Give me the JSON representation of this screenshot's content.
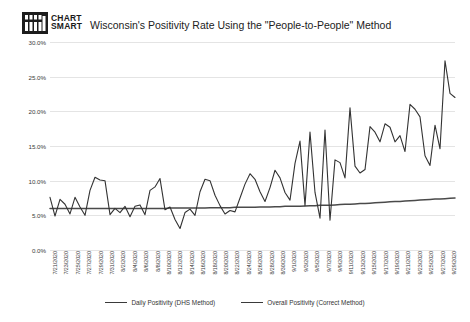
{
  "logo": {
    "name": "Chart Smart",
    "line1": "CHART",
    "line2": "SMART"
  },
  "header": {
    "title": "Wisconsin's Positivity Rate Using the \"People-to-People\" Method"
  },
  "legend": {
    "position": "bottom-center",
    "items": [
      {
        "label": "Daily Positivity (DHS Method)",
        "color": "#3a3a3a"
      },
      {
        "label": "Overall Positivity (Correct Method)",
        "color": "#3a3a3a"
      }
    ]
  },
  "axis": {
    "y_ticks": [
      "0.0%",
      "5.0%",
      "10.0%",
      "15.0%",
      "20.0%",
      "25.0%",
      "30.0%"
    ],
    "y_tick_values": [
      0,
      5,
      10,
      15,
      20,
      25,
      30
    ]
  },
  "chart_data": {
    "type": "line",
    "title": "Wisconsin's Positivity Rate Using the \"People-to-People\" Method",
    "xlabel": "",
    "ylabel": "",
    "ylim": [
      0,
      30
    ],
    "grid": true,
    "legend_position": "bottom",
    "x": [
      "7/21/2020",
      "7/22/2020",
      "7/23/2020",
      "7/24/2020",
      "7/25/2020",
      "7/26/2020",
      "7/27/2020",
      "7/28/2020",
      "7/29/2020",
      "7/30/2020",
      "7/31/2020",
      "8/1/2020",
      "8/2/2020",
      "8/3/2020",
      "8/4/2020",
      "8/5/2020",
      "8/6/2020",
      "8/7/2020",
      "8/8/2020",
      "8/9/2020",
      "8/10/2020",
      "8/11/2020",
      "8/12/2020",
      "8/13/2020",
      "8/14/2020",
      "8/15/2020",
      "8/16/2020",
      "8/17/2020",
      "8/18/2020",
      "8/19/2020",
      "8/20/2020",
      "8/21/2020",
      "8/22/2020",
      "8/23/2020",
      "8/24/2020",
      "8/25/2020",
      "8/26/2020",
      "8/27/2020",
      "8/28/2020",
      "8/29/2020",
      "8/30/2020",
      "8/31/2020",
      "9/1/2020",
      "9/2/2020",
      "9/3/2020",
      "9/4/2020",
      "9/5/2020",
      "9/6/2020",
      "9/7/2020",
      "9/8/2020",
      "9/9/2020",
      "9/10/2020",
      "9/11/2020",
      "9/12/2020",
      "9/13/2020",
      "9/14/2020",
      "9/15/2020",
      "9/16/2020",
      "9/17/2020",
      "9/18/2020",
      "9/19/2020",
      "9/20/2020",
      "9/21/2020",
      "9/22/2020",
      "9/23/2020",
      "9/24/2020",
      "9/25/2020",
      "9/26/2020",
      "9/27/2020",
      "9/28/2020",
      "9/29/2020"
    ],
    "x_tick_labels": [
      "7/21/2020",
      "7/23/2020",
      "7/25/2020",
      "7/27/2020",
      "7/29/2020",
      "7/31/2020",
      "8/2/2020",
      "8/4/2020",
      "8/6/2020",
      "8/8/2020",
      "8/10/2020",
      "8/12/2020",
      "8/14/2020",
      "8/16/2020",
      "8/18/2020",
      "8/20/2020",
      "8/22/2020",
      "8/24/2020",
      "8/26/2020",
      "8/28/2020",
      "8/30/2020",
      "9/1/2020",
      "9/3/2020",
      "9/5/2020",
      "9/7/2020",
      "9/9/2020",
      "9/11/2020",
      "9/13/2020",
      "9/15/2020",
      "9/17/2020",
      "9/19/2020",
      "9/21/2020",
      "9/23/2020",
      "9/25/2020",
      "9/27/2020",
      "9/29/2020"
    ],
    "series": [
      {
        "name": "Daily Positivity (DHS Method)",
        "color": "#3a3a3a",
        "values": [
          7.6,
          4.9,
          7.3,
          6.6,
          5.2,
          7.6,
          6.2,
          5.0,
          8.6,
          10.5,
          10.1,
          10.0,
          5.1,
          6.0,
          5.4,
          6.3,
          4.8,
          6.3,
          6.5,
          5.1,
          8.6,
          9.1,
          10.3,
          5.8,
          6.2,
          4.4,
          3.1,
          5.4,
          5.9,
          5.0,
          8.4,
          10.2,
          10.0,
          7.9,
          6.4,
          5.2,
          5.7,
          5.5,
          7.5,
          9.5,
          11.0,
          10.2,
          8.4,
          7.0,
          9.0,
          11.5,
          10.4,
          8.3,
          7.2,
          12.5,
          15.7,
          6.4,
          17.0,
          8.3,
          4.6,
          17.3,
          4.3,
          13.0,
          12.6,
          10.4,
          20.5,
          12.1,
          11.1,
          11.6,
          17.8,
          17.0,
          15.6,
          18.2,
          17.7,
          15.6,
          16.5
        ],
        "note": "tail continues: sharp rise to peak 27.3 then settles near 22.0"
      },
      {
        "name": "Overall Positivity (Correct Method)",
        "color": "#3a3a3a",
        "values": [
          6.0,
          6.0,
          6.0,
          6.0,
          6.0,
          6.0,
          6.0,
          6.0,
          6.0,
          6.0,
          6.0,
          6.0,
          6.0,
          6.0,
          6.0,
          6.0,
          6.0,
          6.0,
          6.0,
          6.0,
          6.0,
          6.05,
          6.05,
          6.05,
          6.05,
          6.05,
          6.05,
          6.05,
          6.1,
          6.1,
          6.1,
          6.1,
          6.15,
          6.15,
          6.15,
          6.15,
          6.2,
          6.2,
          6.2,
          6.25,
          6.25,
          6.3,
          6.3,
          6.3,
          6.35,
          6.4,
          6.4,
          6.45,
          6.45,
          6.5,
          6.55,
          6.6,
          6.6,
          6.65,
          6.7,
          6.75,
          6.8,
          6.85,
          6.9,
          6.95,
          7.0,
          7.05,
          7.1,
          7.15,
          7.2,
          7.25,
          7.3,
          7.35,
          7.4,
          7.45,
          7.5
        ]
      }
    ],
    "annotations": {
      "peak_value": 27.3,
      "peak_label": "late September peak",
      "final_daily_value": 22.0,
      "overall_start": 6.0,
      "overall_end": 7.5
    }
  }
}
